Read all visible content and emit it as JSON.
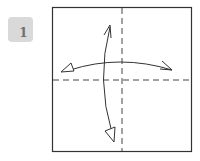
{
  "step": {
    "number": "1",
    "badge_color": "#d9d9d9",
    "number_color": "#6e6e6e"
  },
  "diagram": {
    "elements": [
      {
        "type": "square-outline",
        "x": 52,
        "y": 7,
        "width": 140,
        "height": 145
      },
      {
        "type": "valley-fold-line",
        "orientation": "vertical",
        "position": 122
      },
      {
        "type": "valley-fold-line",
        "orientation": "horizontal",
        "position": 80
      },
      {
        "type": "fold-unfold-arrow",
        "direction": "horizontal"
      },
      {
        "type": "fold-unfold-arrow",
        "direction": "vertical"
      }
    ],
    "line_color": "#333333"
  }
}
